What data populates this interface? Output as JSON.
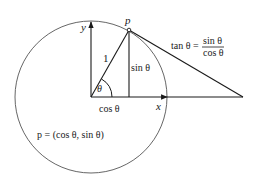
{
  "diagram": {
    "colors": {
      "line": "#1a1a1a",
      "circle": "#555555",
      "background": "#ffffff"
    },
    "labels": {
      "y_axis": "y",
      "x_axis": "x",
      "point": "p",
      "radius": "1",
      "angle": "θ",
      "sin": "sin θ",
      "cos": "cos θ",
      "tan_lhs": "tan θ =",
      "tan_num": "sin θ",
      "tan_den": "cos θ",
      "point_def": "p = (cos θ, sin θ)"
    }
  }
}
